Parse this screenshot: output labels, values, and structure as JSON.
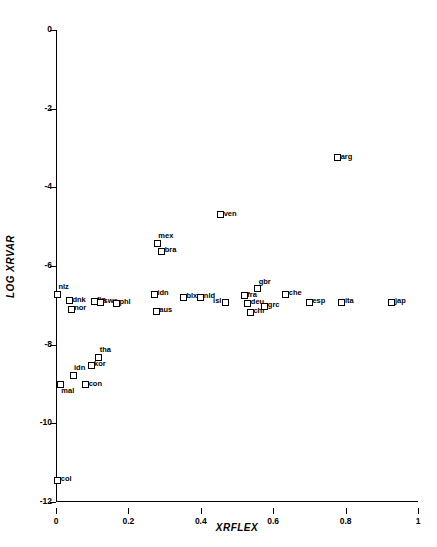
{
  "chart_data": {
    "type": "scatter",
    "title": "",
    "xlabel": "XRFLEX",
    "ylabel": "LOG XRVAR",
    "xlim": [
      0,
      1
    ],
    "ylim": [
      -12,
      0
    ],
    "xticks": [
      "0",
      "0.2",
      "0.4",
      "0.6",
      "0.8",
      "1"
    ],
    "xtick_values": [
      0,
      0.2,
      0.4,
      0.6,
      0.8,
      1
    ],
    "yticks": [
      "0",
      "-2",
      "-4",
      "-6",
      "-8",
      "-10",
      "-12"
    ],
    "ytick_values": [
      0,
      -2,
      -4,
      -6,
      -8,
      -10,
      -12
    ],
    "grid": false,
    "legend": null,
    "marker": "open-square",
    "points": [
      {
        "label": "col",
        "x": 0.005,
        "y": -11.45,
        "pos": "right"
      },
      {
        "label": "mal",
        "x": 0.012,
        "y": -9.02,
        "pos": "below"
      },
      {
        "label": "idn",
        "x": 0.047,
        "y": -8.78,
        "pos": "above"
      },
      {
        "label": "con",
        "x": 0.082,
        "y": -9.02,
        "pos": "right"
      },
      {
        "label": "kor",
        "x": 0.097,
        "y": -8.52,
        "pos": "right"
      },
      {
        "label": "tha",
        "x": 0.118,
        "y": -8.32,
        "pos": "above"
      },
      {
        "label": "nlz",
        "x": 0.004,
        "y": -6.72,
        "pos": "above"
      },
      {
        "label": "dnk",
        "x": 0.037,
        "y": -6.88,
        "pos": "right"
      },
      {
        "label": "nor",
        "x": 0.042,
        "y": -7.1,
        "pos": "right"
      },
      {
        "label": "fin",
        "x": 0.105,
        "y": -6.9,
        "pos": "right"
      },
      {
        "label": "swe",
        "x": 0.123,
        "y": -6.92,
        "pos": "right"
      },
      {
        "label": "phl",
        "x": 0.167,
        "y": -6.95,
        "pos": "right"
      },
      {
        "label": "idn",
        "x": 0.272,
        "y": -6.72,
        "pos": "right"
      },
      {
        "label": "aus",
        "x": 0.277,
        "y": -7.15,
        "pos": "right"
      },
      {
        "label": "mex",
        "x": 0.28,
        "y": -5.42,
        "pos": "above"
      },
      {
        "label": "bra",
        "x": 0.292,
        "y": -5.62,
        "pos": "right"
      },
      {
        "label": "blx",
        "x": 0.352,
        "y": -6.8,
        "pos": "right"
      },
      {
        "label": "nld",
        "x": 0.4,
        "y": -6.8,
        "pos": "right"
      },
      {
        "label": "ven",
        "x": 0.455,
        "y": -4.7,
        "pos": "right"
      },
      {
        "label": "isl",
        "x": 0.468,
        "y": -6.92,
        "pos": "left"
      },
      {
        "label": "fra",
        "x": 0.52,
        "y": -6.75,
        "pos": "right"
      },
      {
        "label": "deu",
        "x": 0.53,
        "y": -6.95,
        "pos": "right"
      },
      {
        "label": "chl",
        "x": 0.537,
        "y": -7.18,
        "pos": "right"
      },
      {
        "label": "gbr",
        "x": 0.557,
        "y": -6.58,
        "pos": "above"
      },
      {
        "label": "grc",
        "x": 0.577,
        "y": -7.02,
        "pos": "right"
      },
      {
        "label": "che",
        "x": 0.635,
        "y": -6.72,
        "pos": "right"
      },
      {
        "label": "esp",
        "x": 0.7,
        "y": -6.92,
        "pos": "right"
      },
      {
        "label": "arg",
        "x": 0.778,
        "y": -3.25,
        "pos": "right"
      },
      {
        "label": "ita",
        "x": 0.79,
        "y": -6.92,
        "pos": "right"
      },
      {
        "label": "jap",
        "x": 0.928,
        "y": -6.92,
        "pos": "right"
      }
    ]
  }
}
